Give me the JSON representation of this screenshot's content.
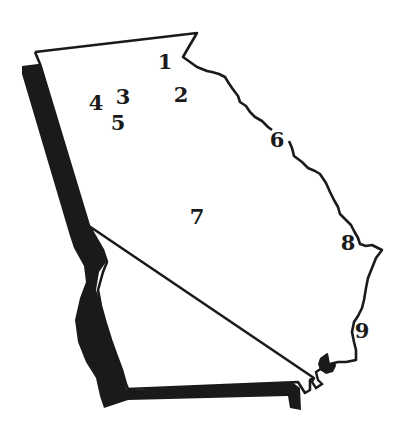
{
  "map": {
    "region": "Georgia state outline",
    "colors": {
      "fill": "#ffffff",
      "outline": "#1a1a1a",
      "shadow": "#1a1a1a",
      "label": "#1a1a1a"
    },
    "labels": [
      {
        "id": "1",
        "text": "1",
        "x": 165,
        "y": 61
      },
      {
        "id": "2",
        "text": "2",
        "x": 181,
        "y": 94
      },
      {
        "id": "3",
        "text": "3",
        "x": 123,
        "y": 96
      },
      {
        "id": "4",
        "text": "4",
        "x": 96,
        "y": 102
      },
      {
        "id": "5",
        "text": "5",
        "x": 118,
        "y": 122
      },
      {
        "id": "6",
        "text": "6",
        "x": 277,
        "y": 139
      },
      {
        "id": "7",
        "text": "7",
        "x": 197,
        "y": 216
      },
      {
        "id": "8",
        "text": "8",
        "x": 348,
        "y": 242
      },
      {
        "id": "9",
        "text": "9",
        "x": 362,
        "y": 330
      }
    ]
  }
}
